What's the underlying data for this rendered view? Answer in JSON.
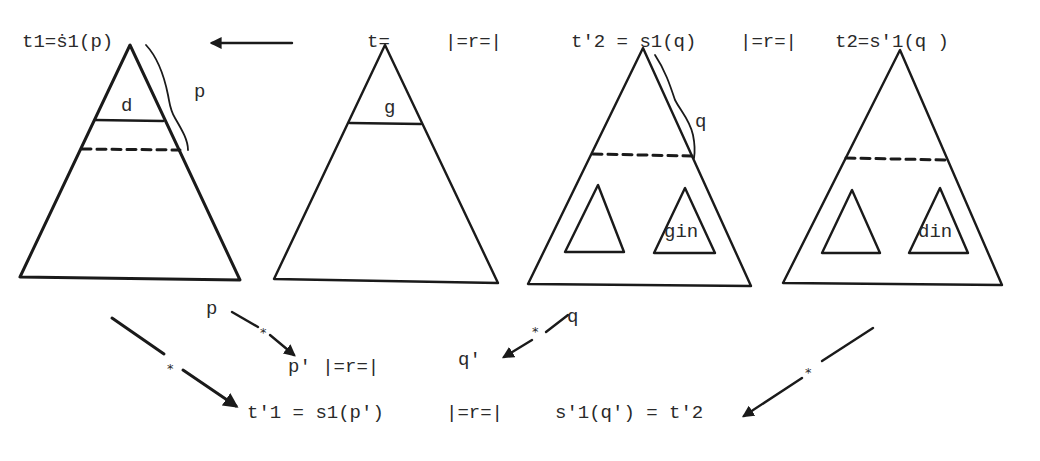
{
  "diagram": {
    "top_labels": {
      "t1": "t1=ṡ1(p)",
      "t": "t=",
      "r1": "|=r=|",
      "t_prime2": "t'2 = s1(q)",
      "r2": "|=r=|",
      "t2": "t2=s'1(q )"
    },
    "tree_labels": {
      "d": "d",
      "p_side": "p",
      "g": "g",
      "q_side": "q",
      "gin": "gin",
      "din": "din"
    },
    "bottom_labels": {
      "p": "p",
      "p_prime_rel": "p' |=r=|",
      "q_prime": "q'",
      "q": "q",
      "t_prime1": "t'1 = s1(p')",
      "r3": "|=r=|",
      "s_prime1": "s'1(q') = t'2"
    },
    "star": "*"
  }
}
